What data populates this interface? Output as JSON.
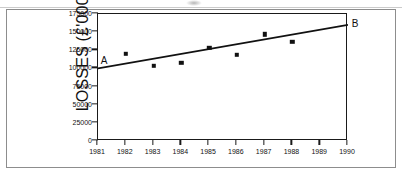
{
  "figure": {
    "has_outer_frame": true,
    "background_color": "#ffffff",
    "ink_color": "#111111"
  },
  "chart_data": {
    "type": "scatter",
    "title": "",
    "xlabel": "",
    "ylabel": "LOSSES (£'000)",
    "x": [
      1982,
      1983,
      1984,
      1985,
      1986,
      1987,
      1988
    ],
    "values": [
      120000,
      104000,
      108000,
      128000,
      119000,
      147000,
      137000
    ],
    "series": [
      {
        "name": "Losses",
        "marker": "filled-square",
        "color": "#111111",
        "points": [
          {
            "x": 1982,
            "y": 120000
          },
          {
            "x": 1983,
            "y": 104000
          },
          {
            "x": 1984,
            "y": 108000
          },
          {
            "x": 1985,
            "y": 128000
          },
          {
            "x": 1986,
            "y": 119000
          },
          {
            "x": 1987,
            "y": 147000
          },
          {
            "x": 1988,
            "y": 137000
          }
        ]
      },
      {
        "name": "Trend line AB",
        "type": "line",
        "color": "#111111",
        "points": [
          {
            "x": 1981,
            "y": 100000,
            "label": "A"
          },
          {
            "x": 1990,
            "y": 160000,
            "label": "B"
          }
        ]
      }
    ],
    "xlim": [
      1981,
      1990
    ],
    "ylim": [
      0,
      175000
    ],
    "xticks": [
      1981,
      1982,
      1983,
      1984,
      1985,
      1986,
      1987,
      1988,
      1989,
      1990
    ],
    "xticklabels": [
      "1981",
      "1982",
      "1983",
      "1984",
      "1985",
      "1986",
      "1987",
      "1988",
      "1989",
      "1990"
    ],
    "yticks": [
      0,
      25000,
      50000,
      75000,
      100000,
      125000,
      150000,
      175000
    ],
    "yticklabels": [
      "0",
      "25000",
      "50000",
      "75000",
      "100000",
      "125000",
      "150000",
      "175000"
    ],
    "grid": false,
    "legend": null,
    "annotations": [
      {
        "text": "A",
        "x": 1981,
        "y": 112000,
        "note": "start of trend line"
      },
      {
        "text": "B",
        "x": 1990,
        "y": 163000,
        "note": "end of trend line"
      }
    ]
  }
}
